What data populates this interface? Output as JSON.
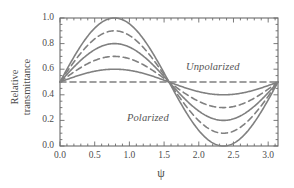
{
  "figure": {
    "background": "#ffffff",
    "line_color": "#808080",
    "frame_color": "#6b6b6b"
  },
  "chart_data": {
    "type": "line",
    "title": "",
    "xlabel": "ψ",
    "ylabel_line1": "Relative",
    "ylabel_line2": "transmittance",
    "xlim": [
      0.0,
      3.1416
    ],
    "ylim": [
      0.0,
      1.0
    ],
    "xticks": [
      0.0,
      0.5,
      1.0,
      1.5,
      2.0,
      2.5,
      3.0
    ],
    "xtick_labels": [
      "0.0",
      "0.5",
      "1.0",
      "1.5",
      "2.0",
      "2.5",
      "3.0"
    ],
    "yticks": [
      0.0,
      0.2,
      0.4,
      0.6,
      0.8,
      1.0
    ],
    "ytick_labels": [
      "0.0",
      "0.2",
      "0.4",
      "0.6",
      "0.8",
      "1.0"
    ],
    "grid": false,
    "legend": "none",
    "function_form": "T(psi) = 0.5 + A * sin(2*psi)",
    "series": [
      {
        "name": "A = 0.5",
        "amplitude": 0.5,
        "style": "solid",
        "peak": 1.0,
        "trough": 0.0,
        "color": "#808080"
      },
      {
        "name": "A = 0.4",
        "amplitude": 0.4,
        "style": "dashed",
        "peak": 0.9,
        "trough": 0.1,
        "color": "#808080"
      },
      {
        "name": "A = 0.3",
        "amplitude": 0.3,
        "style": "solid",
        "peak": 0.8,
        "trough": 0.2,
        "color": "#808080"
      },
      {
        "name": "A = 0.2",
        "amplitude": 0.2,
        "style": "dashed",
        "peak": 0.7,
        "trough": 0.3,
        "color": "#808080"
      },
      {
        "name": "A = 0.1",
        "amplitude": 0.1,
        "style": "solid",
        "peak": 0.6,
        "trough": 0.4,
        "color": "#808080"
      },
      {
        "name": "A = 0.0",
        "amplitude": 0.0,
        "style": "dashed",
        "peak": 0.5,
        "trough": 0.5,
        "color": "#808080"
      }
    ],
    "annotations": [
      {
        "text": "Unpolarized",
        "x": 2.0,
        "y": 0.56,
        "style": "italic"
      },
      {
        "text": "Polarized",
        "x": 1.15,
        "y": 0.24,
        "style": "italic"
      }
    ]
  }
}
